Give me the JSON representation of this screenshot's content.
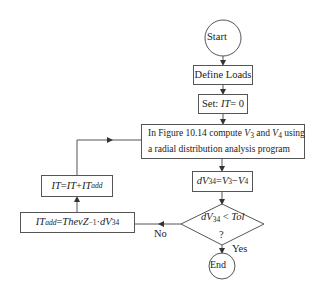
{
  "flowchart": {
    "start": {
      "label": "Start"
    },
    "define_loads": {
      "label": "Define Loads"
    },
    "set_it": {
      "prefix": "Set: ",
      "var": "IT",
      "rest": " = 0"
    },
    "compute": {
      "line1_a": "In Figure 10.14 compute ",
      "v3": "V",
      "v3_sub": "3",
      "and": " and ",
      "v4": "V",
      "v4_sub": "4",
      "line1_b": " using",
      "line2": "a radial distribution analysis program"
    },
    "dv": {
      "lhs": "dV",
      "lhs_sub": "34",
      "eq": " = ",
      "a": "V",
      "a_sub": "3",
      "minus": " − ",
      "b": "V",
      "b_sub": "4"
    },
    "decision": {
      "lhs": "dV",
      "lhs_sub": "34",
      "op": " < ",
      "rhs": "Tol",
      "q": "?"
    },
    "it_update": {
      "lhs": "IT",
      "eq": " = ",
      "a": "IT",
      "plus": " + ",
      "b": "IT",
      "b_sub": "add"
    },
    "it_add": {
      "lhs": "IT",
      "lhs_sub": "add",
      "eq": " = ",
      "rhs": "ThevZ",
      "sup": "−1",
      "dot": " · ",
      "dv": "dV",
      "dv_sub": "34"
    },
    "no_label": "No",
    "yes_label": "Yes",
    "end": {
      "label": "End"
    }
  },
  "colors": {
    "stroke": "#555555",
    "text": "#222222",
    "background": "#ffffff"
  }
}
